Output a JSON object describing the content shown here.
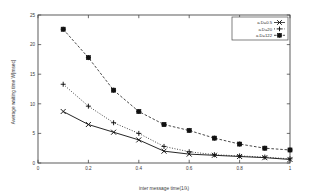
{
  "chart_data": {
    "type": "line",
    "title": "",
    "xlabel": "inter message time(1/λ)",
    "ylabel": "Average waiting time W[msec]",
    "xlim": [
      0,
      1
    ],
    "ylim": [
      0,
      25
    ],
    "grid": false,
    "legend_position": "top-right",
    "x": [
      0.1,
      0.2,
      0.3,
      0.4,
      0.5,
      0.6,
      0.7,
      0.8,
      0.9,
      1.0
    ],
    "xticks": [
      "0",
      "0.2",
      "0.4",
      "0.6",
      "0.8",
      "1"
    ],
    "xtick_values": [
      0,
      0.2,
      0.4,
      0.6,
      0.8,
      1
    ],
    "yticks": [
      "0",
      "5",
      "10",
      "15",
      "20",
      "25"
    ],
    "ytick_values": [
      0,
      5,
      10,
      15,
      20,
      25
    ],
    "series": [
      {
        "name": "a.D=0.5",
        "marker": "x-cross",
        "linestyle": "solid",
        "values": [
          8.7,
          6.5,
          5.2,
          3.9,
          2.0,
          1.5,
          1.3,
          1.1,
          0.9,
          0.6
        ]
      },
      {
        "name": "a.D=20",
        "marker": "plus",
        "linestyle": "dotted",
        "values": [
          13.3,
          9.6,
          6.8,
          5.0,
          2.8,
          1.9,
          1.4,
          1.2,
          1.0,
          0.7
        ]
      },
      {
        "name": "a.D=122",
        "marker": "square-star",
        "linestyle": "dashed",
        "values": [
          22.6,
          17.8,
          12.3,
          8.7,
          6.5,
          5.5,
          4.2,
          3.2,
          2.5,
          2.2
        ]
      }
    ]
  },
  "legend": {
    "entries": [
      {
        "label": "a.D=0.5"
      },
      {
        "label": "a.D=20"
      },
      {
        "label": "a.D=122"
      }
    ]
  }
}
